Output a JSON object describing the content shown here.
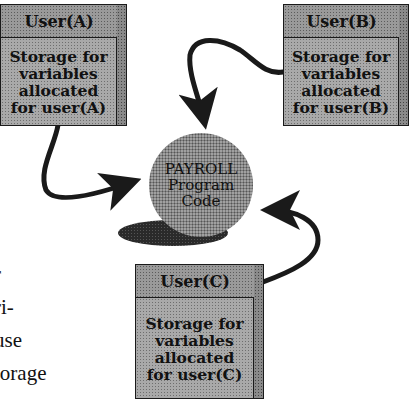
{
  "diagram": {
    "central_node": {
      "label": "PAYROLL\nProgram\nCode",
      "fill": "#a0a0a0"
    },
    "users": [
      {
        "id": "A",
        "header": "User(A)",
        "body": "Storage for\nvariables\nallocated\nfor user(A)",
        "arrow": "to-program"
      },
      {
        "id": "B",
        "header": "User(B)",
        "body": "Storage for\nvariables\nallocated\nfor user(B)",
        "arrow": "to-program"
      },
      {
        "id": "C",
        "header": "User(C)",
        "body": "Storage for\nvariables\nallocated\nfor user(C)",
        "arrow": "to-program"
      }
    ],
    "colors": {
      "box_fill": "#a9a9a9",
      "outline": "#1a1a1a",
      "arrow": "#1a1a1a",
      "shadow": "#2a2a2a"
    }
  },
  "surrounding_text": {
    "lines": [
      "r",
      "ri-",
      "use",
      "torage"
    ]
  }
}
